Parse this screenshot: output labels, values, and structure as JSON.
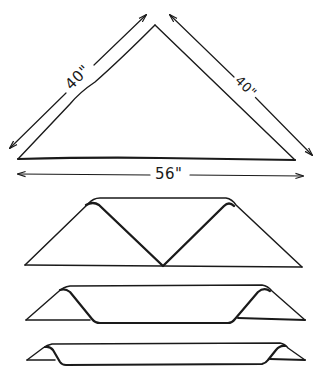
{
  "diagram": {
    "ink_color": "#1a1a1a",
    "background": "#ffffff",
    "steps": [
      {
        "id": "step-1-triangle",
        "shape": "triangle",
        "dimensions": {
          "left_side": "40\"",
          "right_side": "40\"",
          "base": "56\""
        }
      },
      {
        "id": "step-2-apex-folded-to-base",
        "shape": "trapezoid with inner V fold"
      },
      {
        "id": "step-3-folded-again",
        "shape": "flattened band with triangular ends"
      },
      {
        "id": "step-4-narrow-cravat",
        "shape": "narrow band with small triangular ends"
      }
    ]
  },
  "labels": {
    "left_side": "40\"",
    "right_side": "40\"",
    "base": "56\""
  }
}
